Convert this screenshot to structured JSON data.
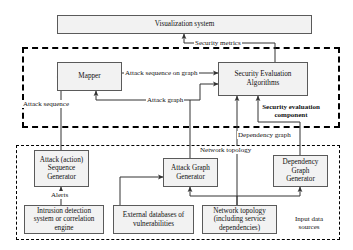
{
  "diagram": {
    "nodes": {
      "visualization_system": "Visualization system",
      "mapper": "Mapper",
      "security_evaluation_algorithms": "Security Evaluation\nAlgorithms",
      "attack_sequence_generator": "Attack (action)\nSequence\nGenerator",
      "attack_graph_generator": "Attack Graph\nGenerator",
      "dependency_graph_generator": "Dependency\nGraph\nGenerator",
      "ids_correlation_engine": "Intrusion detection\nsystem or correlation\nengine",
      "external_vulnerability_db": "External databases of\nvulnerabilities",
      "network_topology_source": "Network topology\n(including service\ndependencies)"
    },
    "edge_labels": {
      "security_metrics": "Security metrics",
      "attack_sequence_on_graph": "Attack sequence on graph",
      "attack_graph": "Attack graph",
      "attack_sequence": "Attack sequence",
      "alerts": "Alerts",
      "dependency_graph": "Dependency graph",
      "network_topology": "Network topology"
    },
    "zone_labels": {
      "security_evaluation_component": "Security evaluation\ncomponent",
      "input_data_sources": "Input data\nsources"
    },
    "colors": {
      "node_fill": "#f2f2f2",
      "node_border": "#5a5a5a",
      "line": "#333333",
      "zone_border": "#000000",
      "text": "#111111",
      "background": "#ffffff"
    }
  }
}
